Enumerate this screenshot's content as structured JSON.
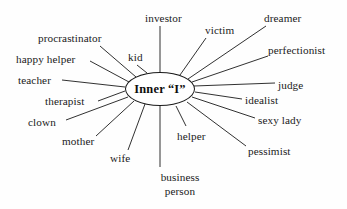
{
  "diagram": {
    "type": "radial-spoke",
    "center": {
      "label": "Inner “I”",
      "shape": "ellipse",
      "cx": 160,
      "cy": 89,
      "rx": 35,
      "ry": 17
    },
    "colors": {
      "background": "#fefefe",
      "stroke": "#1a1a1a",
      "text": "#1a1a1a",
      "center_text": "#0d0d0d"
    },
    "nodes": [
      {
        "id": "investor",
        "label": "investor",
        "x": 145,
        "y": 12,
        "align": "left",
        "line": {
          "x1": 160,
          "y1": 72,
          "x2": 160,
          "y2": 26
        }
      },
      {
        "id": "victim",
        "label": "victim",
        "x": 205,
        "y": 24,
        "align": "left",
        "line": {
          "x1": 180,
          "y1": 75,
          "x2": 206,
          "y2": 38
        }
      },
      {
        "id": "dreamer",
        "label": "dreamer",
        "x": 264,
        "y": 12,
        "align": "left",
        "line": {
          "x1": 188,
          "y1": 79,
          "x2": 266,
          "y2": 26
        }
      },
      {
        "id": "perfectionist",
        "label": "perfectionist",
        "x": 268,
        "y": 44,
        "align": "left",
        "line": {
          "x1": 192,
          "y1": 82,
          "x2": 268,
          "y2": 56
        }
      },
      {
        "id": "judge",
        "label": "judge",
        "x": 278,
        "y": 79,
        "align": "left",
        "line": {
          "x1": 194,
          "y1": 86,
          "x2": 275,
          "y2": 83
        }
      },
      {
        "id": "idealist",
        "label": "idealist",
        "x": 245,
        "y": 94,
        "align": "left",
        "line": {
          "x1": 195,
          "y1": 92,
          "x2": 242,
          "y2": 99
        }
      },
      {
        "id": "sexy-lady",
        "label": "sexy lady",
        "x": 258,
        "y": 114,
        "align": "left",
        "line": {
          "x1": 192,
          "y1": 97,
          "x2": 255,
          "y2": 118
        }
      },
      {
        "id": "pessimist",
        "label": "pessimist",
        "x": 248,
        "y": 145,
        "align": "left",
        "line": {
          "x1": 187,
          "y1": 102,
          "x2": 246,
          "y2": 146
        }
      },
      {
        "id": "helper",
        "label": "helper",
        "x": 177,
        "y": 130,
        "align": "left",
        "line": {
          "x1": 176,
          "y1": 106,
          "x2": 186,
          "y2": 126
        }
      },
      {
        "id": "business-person",
        "label": "business person",
        "label_lines": [
          "business",
          "person"
        ],
        "x": 136,
        "y": 171,
        "align": "center",
        "line": {
          "x1": 160,
          "y1": 106,
          "x2": 160,
          "y2": 167
        }
      },
      {
        "id": "wife",
        "label": "wife",
        "x": 110,
        "y": 152,
        "align": "left",
        "line": {
          "x1": 145,
          "y1": 104,
          "x2": 128,
          "y2": 150
        }
      },
      {
        "id": "mother",
        "label": "mother",
        "x": 62,
        "y": 135,
        "align": "left",
        "line": {
          "x1": 134,
          "y1": 101,
          "x2": 96,
          "y2": 136
        }
      },
      {
        "id": "clown",
        "label": "clown",
        "x": 28,
        "y": 116,
        "align": "left",
        "line": {
          "x1": 128,
          "y1": 97,
          "x2": 66,
          "y2": 120
        }
      },
      {
        "id": "therapist",
        "label": "therapist",
        "x": 45,
        "y": 95,
        "align": "left",
        "line": {
          "x1": 125,
          "y1": 91,
          "x2": 98,
          "y2": 101
        }
      },
      {
        "id": "teacher",
        "label": "teacher",
        "x": 18,
        "y": 74,
        "align": "left",
        "line": {
          "x1": 125,
          "y1": 87,
          "x2": 62,
          "y2": 80
        }
      },
      {
        "id": "happy-helper",
        "label": "happy helper",
        "x": 16,
        "y": 53,
        "align": "left",
        "line": {
          "x1": 129,
          "y1": 82,
          "x2": 90,
          "y2": 61
        }
      },
      {
        "id": "procrastinator",
        "label": "procrastinator",
        "x": 38,
        "y": 32,
        "align": "left",
        "line": {
          "x1": 136,
          "y1": 77,
          "x2": 100,
          "y2": 46
        }
      },
      {
        "id": "kid",
        "label": "kid",
        "x": 128,
        "y": 51,
        "align": "left",
        "line": {
          "x1": 147,
          "y1": 73,
          "x2": 137,
          "y2": 65
        }
      }
    ]
  }
}
